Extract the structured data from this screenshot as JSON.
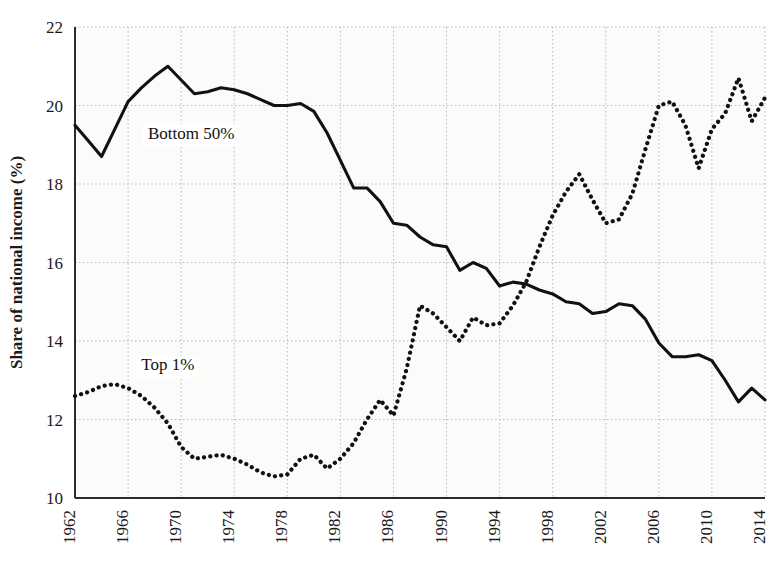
{
  "chart_data": {
    "type": "line",
    "title": "",
    "xlabel": "",
    "ylabel": "Share of national income (%)",
    "xlim": [
      1962,
      2014
    ],
    "ylim": [
      10,
      22
    ],
    "yticks": [
      10,
      12,
      14,
      16,
      18,
      20,
      22
    ],
    "xticks": [
      1962,
      1966,
      1970,
      1974,
      1978,
      1982,
      1986,
      1990,
      1994,
      1998,
      2002,
      2006,
      2010,
      2014
    ],
    "grid": true,
    "legend_position": "inline-annotations",
    "x": [
      1962,
      1963,
      1964,
      1965,
      1966,
      1967,
      1968,
      1969,
      1970,
      1971,
      1972,
      1973,
      1974,
      1975,
      1976,
      1977,
      1978,
      1979,
      1980,
      1981,
      1982,
      1983,
      1984,
      1985,
      1986,
      1987,
      1988,
      1989,
      1990,
      1991,
      1992,
      1993,
      1994,
      1995,
      1996,
      1997,
      1998,
      1999,
      2000,
      2001,
      2002,
      2003,
      2004,
      2005,
      2006,
      2007,
      2008,
      2009,
      2010,
      2011,
      2012,
      2013,
      2014
    ],
    "series": [
      {
        "name": "Bottom 50%",
        "style": "solid",
        "color": "#111111",
        "label_x": 1967.5,
        "label_y": 19.15,
        "values": [
          19.5,
          19.1,
          18.7,
          19.4,
          20.1,
          20.45,
          20.75,
          21.0,
          20.65,
          20.3,
          20.35,
          20.45,
          20.4,
          20.3,
          20.15,
          20.0,
          20.0,
          20.05,
          19.85,
          19.3,
          18.6,
          17.9,
          17.9,
          17.55,
          17.0,
          16.95,
          16.65,
          16.45,
          16.4,
          15.8,
          16.0,
          15.85,
          15.4,
          15.5,
          15.45,
          15.3,
          15.2,
          15.0,
          14.95,
          14.7,
          14.75,
          14.95,
          14.9,
          14.55,
          13.95,
          13.6,
          13.6,
          13.65,
          13.5,
          13.0,
          12.45,
          12.8,
          12.5
        ]
      },
      {
        "name": "Top 1%",
        "style": "dotted",
        "color": "#111111",
        "label_x": 1967.0,
        "label_y": 13.25,
        "values": [
          12.6,
          12.7,
          12.85,
          12.9,
          12.8,
          12.6,
          12.3,
          11.9,
          11.3,
          11.0,
          11.05,
          11.1,
          11.0,
          10.85,
          10.65,
          10.55,
          10.6,
          11.0,
          11.1,
          10.75,
          11.0,
          11.4,
          12.0,
          12.5,
          12.1,
          13.3,
          14.9,
          14.7,
          14.35,
          14.0,
          14.6,
          14.4,
          14.45,
          14.9,
          15.5,
          16.4,
          17.2,
          17.8,
          18.25,
          17.6,
          17.0,
          17.1,
          17.75,
          18.9,
          20.0,
          20.1,
          19.5,
          18.4,
          19.4,
          19.8,
          20.7,
          19.6,
          20.2
        ]
      }
    ]
  },
  "axis": {
    "y_title": "Share of national income (%)",
    "y_tick_labels": [
      "10",
      "12",
      "14",
      "16",
      "18",
      "20",
      "22"
    ],
    "x_tick_labels": [
      "1962",
      "1966",
      "1970",
      "1974",
      "1978",
      "1982",
      "1986",
      "1990",
      "1994",
      "1998",
      "2002",
      "2006",
      "2010",
      "2014"
    ]
  },
  "annotations": [
    {
      "text": "Bottom 50%"
    },
    {
      "text": "Top 1%"
    }
  ],
  "colors": {
    "line": "#111111",
    "grid": "#b8b8b8",
    "axis": "#2b2b2b",
    "plot_background": "#fbfbfa",
    "text": "#1a1a1a"
  }
}
